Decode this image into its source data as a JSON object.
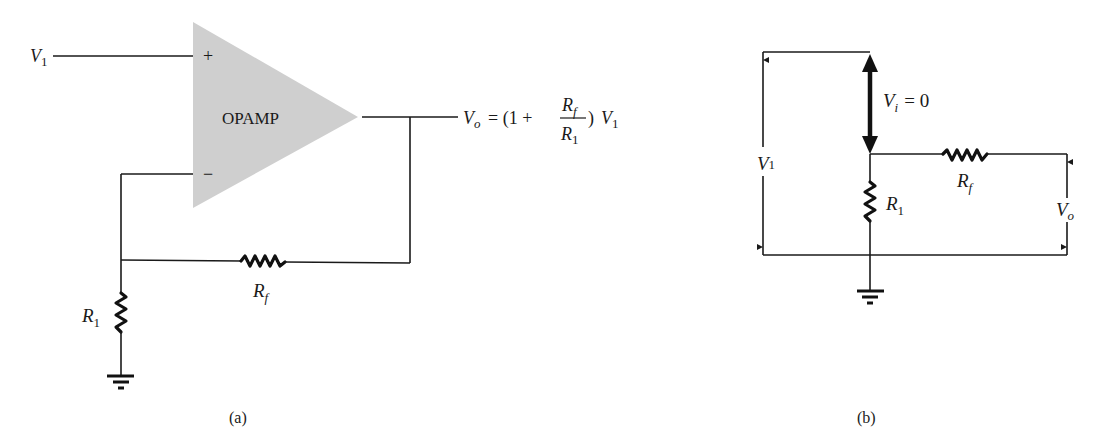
{
  "figure_a": {
    "caption": "(a)",
    "opamp_label": "OPAMP",
    "plus_sign": "+",
    "minus_sign": "−",
    "input_label": {
      "main": "V",
      "sub": "1"
    },
    "output_equation": {
      "lhs_main": "V",
      "lhs_sub": "o",
      "equals_open": "= (1 +",
      "num_main": "R",
      "num_sub": "f",
      "den_main": "R",
      "den_sub": "1",
      "close": ")",
      "rhs_main": "V",
      "rhs_sub": "1"
    },
    "rf_label": {
      "main": "R",
      "sub": "f"
    },
    "r1_label": {
      "main": "R",
      "sub": "1"
    },
    "opamp_color": "#cfcfcf"
  },
  "figure_b": {
    "caption": "(b)",
    "v1_label": {
      "main": "V",
      "sub": "1"
    },
    "vi_label": {
      "main": "V",
      "sub": "i",
      "rest": "= 0"
    },
    "rf_label": {
      "main": "R",
      "sub": "f"
    },
    "r1_label": {
      "main": "R",
      "sub": "1"
    },
    "vo_label": {
      "main": "V",
      "sub": "o"
    }
  }
}
